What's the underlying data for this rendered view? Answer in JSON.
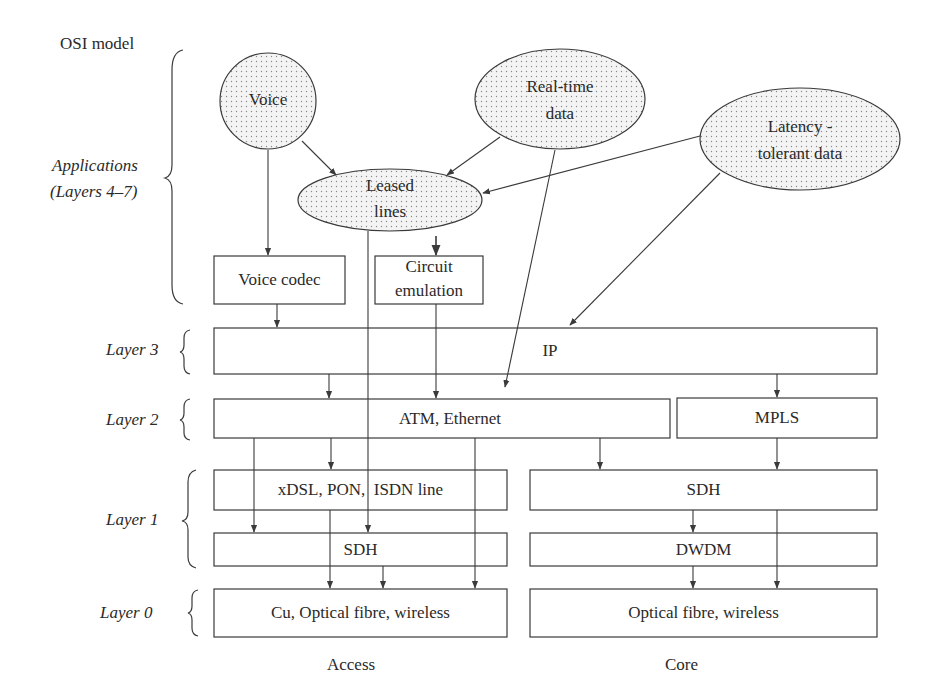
{
  "title": "OSI model",
  "layers": {
    "applications": "Applications",
    "applications_sub": "(Layers 4–7)",
    "layer3": "Layer 3",
    "layer2": "Layer 2",
    "layer1": "Layer 1",
    "layer0": "Layer  0"
  },
  "applications": {
    "voice": "Voice",
    "realtime_line1": "Real-time",
    "realtime_line2": "data",
    "latency_line1": "Latency -",
    "latency_line2": "tolerant data",
    "leased_line1": "Leased",
    "leased_line2": "lines"
  },
  "adapters": {
    "voice_codec": "Voice codec",
    "circuit_line1": "Circuit",
    "circuit_line2": "emulation"
  },
  "boxes": {
    "ip": "IP",
    "atm_ethernet": "ATM, Ethernet",
    "mpls": "MPLS",
    "access_l1": "xDSL, PON,  ISDN line",
    "access_sdh": "SDH",
    "core_sdh": "SDH",
    "core_dwdm": "DWDM",
    "access_l0": "Cu, Optical fibre, wireless",
    "core_l0": "Optical fibre, wireless"
  },
  "columns": {
    "access": "Access",
    "core": "Core"
  },
  "colors": {
    "stroke": "#3a3a3a",
    "fill_dots": "#9a9a9a",
    "fill_bg": "#f2f2f2"
  }
}
